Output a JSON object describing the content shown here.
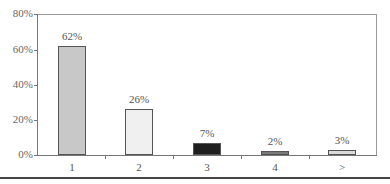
{
  "chart_data": {
    "type": "bar",
    "title": "",
    "xlabel": "",
    "ylabel": "",
    "categories": [
      "1",
      "2",
      "3",
      "4",
      ">"
    ],
    "values": [
      62,
      26,
      7,
      2,
      3
    ],
    "value_labels": [
      "62%",
      "26%",
      "7%",
      "2%",
      "3%"
    ],
    "bar_colors": [
      "#c8c8c8",
      "#f0f0f0",
      "#1e1e1e",
      "#7a7a7a",
      "#dadada"
    ],
    "ylim": [
      0,
      80
    ],
    "yticks": [
      "0%",
      "20%",
      "40%",
      "60%",
      "80%"
    ],
    "grid": false,
    "legend": null
  }
}
